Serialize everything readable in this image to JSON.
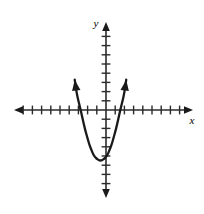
{
  "figure": {
    "background_color": "#ffffff",
    "stroke_color": "#1a1a1a",
    "axis_color": "#2b2b2b"
  },
  "axes": {
    "x_axis_label": "x",
    "y_axis_label": "y",
    "x_axis_name": "horizontal-axis",
    "y_axis_name": "vertical-axis",
    "origin_px": {
      "x": 106,
      "y": 110
    },
    "tick_spacing_px": 9.2,
    "x_ticks_left_count": 10,
    "x_ticks_right_count": 9,
    "y_ticks_up_count": 9,
    "y_ticks_down_count": 9,
    "tick_half_length_px": 4,
    "arrowheads": [
      "left",
      "right",
      "up",
      "down"
    ],
    "gridlines": false,
    "tick_labels_shown": false
  },
  "chart_data": {
    "type": "line",
    "title": "",
    "subtitle": "",
    "xlabel": "x",
    "ylabel": "y",
    "xlim": [
      -10,
      9
    ],
    "ylim": [
      -9,
      9
    ],
    "grid": false,
    "legend": "none",
    "annotations": [],
    "series": [
      {
        "name": "parabola",
        "equation": "y = 1.2(x + 0.6)^2 - 5.5",
        "vertex": [
          -0.6,
          -5.5
        ],
        "x_intercepts": [
          -2.7,
          1.5
        ],
        "y_intercept": -5.1,
        "opens": "up",
        "endpoint_arrows": true,
        "x": [
          -3.4,
          -3.2,
          -3.0,
          -2.8,
          -2.6,
          -2.4,
          -2.2,
          -2.0,
          -1.8,
          -1.6,
          -1.4,
          -1.2,
          -1.0,
          -0.8,
          -0.6,
          -0.4,
          -0.2,
          0.0,
          0.2,
          0.4,
          0.6,
          0.8,
          1.0,
          1.2,
          1.4,
          1.6,
          1.8,
          2.0,
          2.2
        ],
        "y": [
          3.3,
          1.9,
          1.0,
          0.2,
          -0.7,
          -1.6,
          -2.4,
          -3.1,
          -3.8,
          -4.3,
          -4.8,
          -5.1,
          -5.3,
          -5.45,
          -5.5,
          -5.45,
          -5.3,
          -5.1,
          -4.8,
          -4.3,
          -3.8,
          -3.1,
          -2.4,
          -1.6,
          -0.7,
          0.2,
          1.0,
          1.9,
          3.3
        ]
      }
    ]
  }
}
